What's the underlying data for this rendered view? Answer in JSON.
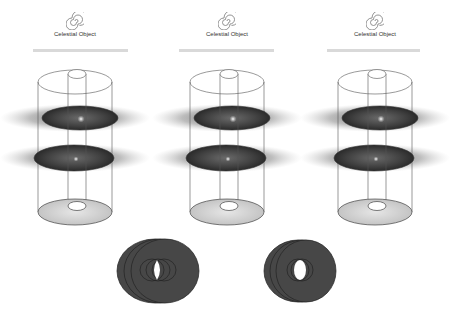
{
  "panels": [
    {
      "caption": "Celestial Object",
      "icon": "spiral-icon"
    },
    {
      "caption": "Celestial Object",
      "icon": "spiral-icon"
    },
    {
      "caption": "Celestial Object",
      "icon": "spiral-icon"
    }
  ],
  "colors": {
    "background": "#ffffff",
    "disk_dark": "#3a3a3a",
    "disk_light": "#d4d4d4",
    "outline": "#444444",
    "rule": "#d9d9d9",
    "ring_fill": "#474747"
  },
  "bottom_figures": [
    {
      "name": "offset-ring-stack-left"
    },
    {
      "name": "offset-ring-stack-right"
    }
  ]
}
